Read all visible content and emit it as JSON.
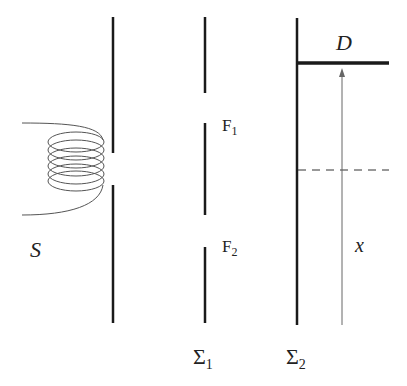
{
  "diagram": {
    "labels": {
      "source": "S",
      "slit_top": "F",
      "slit_top_sub": "1",
      "slit_bottom": "F",
      "slit_bottom_sub": "2",
      "barrier_1": "Σ",
      "barrier_1_sub": "1",
      "screen": "Σ",
      "screen_sub": "2",
      "detector": "D",
      "position": "x"
    },
    "colors": {
      "line": "#1a1a1a",
      "coil": "#555555",
      "thin_line": "#666666",
      "background": "#ffffff"
    }
  }
}
